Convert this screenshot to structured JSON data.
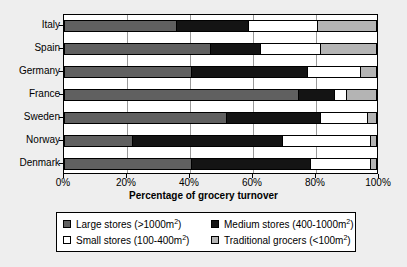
{
  "chart_data": {
    "type": "bar",
    "orientation": "horizontal",
    "stacked": true,
    "stack_mode": "percent",
    "title": "",
    "xlabel": "Percentage of grocery turnover",
    "ylabel": "",
    "xlim": [
      0,
      100
    ],
    "grid": true,
    "legend_position": "bottom",
    "xtick_labels": [
      "0%",
      "20%",
      "40%",
      "60%",
      "80%",
      "100%"
    ],
    "xtick_values": [
      0,
      20,
      40,
      60,
      80,
      100
    ],
    "categories": [
      "Italy",
      "Spain",
      "Germany",
      "France",
      "Sweden",
      "Norway",
      "Denmark"
    ],
    "series": [
      {
        "name": "Large stores (>1000m2)",
        "label_main": "Large stores (>1000m",
        "label_sup": "2",
        "label_tail": ")",
        "color": "#606060",
        "values": [
          36,
          47,
          41,
          75,
          52,
          22,
          41
        ]
      },
      {
        "name": "Medium stores (400-1000m2)",
        "label_main": "Medium stores (400-1000m",
        "label_sup": "2",
        "label_tail": ")",
        "color": "#141414",
        "values": [
          23,
          16,
          37,
          11.5,
          30,
          48,
          38
        ]
      },
      {
        "name": "Small stores (100-400m2)",
        "label_main": "Small stores (100-400m",
        "label_sup": "2",
        "label_tail": ")",
        "color": "#ffffff",
        "values": [
          22,
          19,
          17,
          4,
          15,
          28,
          19
        ]
      },
      {
        "name": "Traditional grocers (<100m2)",
        "label_main": "Traditional grocers (<100m",
        "label_sup": "2",
        "label_tail": ")",
        "color": "#b4b4b4",
        "values": [
          19,
          18,
          5,
          9.5,
          3,
          2,
          2
        ]
      }
    ]
  }
}
